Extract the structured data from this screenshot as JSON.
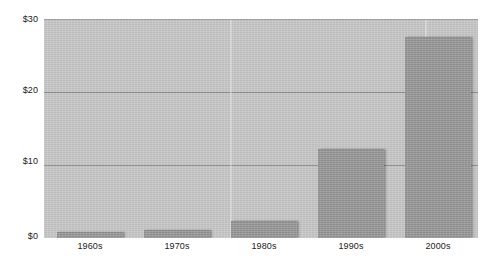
{
  "chart_data": {
    "type": "bar",
    "title": "",
    "subtitle": "",
    "xlabel": "",
    "ylabel": "",
    "categories": [
      "1960s",
      "1970s",
      "1980s",
      "1990s",
      "2000s"
    ],
    "values": [
      0.7,
      1.0,
      2.2,
      12.0,
      27.4
    ],
    "series": [
      {
        "name": "",
        "values": [
          0.7,
          1.0,
          2.2,
          12.0,
          27.4
        ]
      }
    ],
    "ylim": [
      0,
      30
    ],
    "ytick_values": [
      0,
      10,
      20,
      30
    ],
    "ytick_labels": [
      "$0",
      "$10",
      "$20",
      "$30"
    ],
    "xtick_labels": [
      "1960s",
      "1970s",
      "1980s",
      "1990s",
      "2000s"
    ],
    "grid": true,
    "grid_axis": "y",
    "legend": false,
    "legend_position": "none",
    "annotations": [],
    "colors": {
      "bar_fill": "#9a9a9a",
      "plot_background": "#c9c9c9",
      "gridline": "#8f8f8f",
      "figure_background": "#ffffff",
      "text": "#222222"
    }
  },
  "axes": {
    "y_ticks": [
      {
        "label": "$30",
        "value": 30
      },
      {
        "label": "$20",
        "value": 20
      },
      {
        "label": "$10",
        "value": 10
      },
      {
        "label": "$0",
        "value": 0
      }
    ],
    "x_ticks": [
      {
        "label": "1960s"
      },
      {
        "label": "1970s"
      },
      {
        "label": "1980s"
      },
      {
        "label": "1990s"
      },
      {
        "label": "2000s"
      }
    ]
  }
}
